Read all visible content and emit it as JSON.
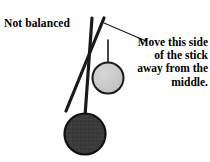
{
  "figure": {
    "background_color": "#ffffff",
    "ink_color": "#1a1a1a",
    "labels": {
      "not_balanced": "Not balanced",
      "callout": "Move this side of the stick away from the middle."
    },
    "parts": {
      "vertical_stick_name": "vertical-stick",
      "diagonal_stick_name": "diagonal-stick",
      "hanger_line_name": "hanger-line",
      "leader_line_name": "callout-leader-line"
    },
    "weights": [
      {
        "id": "light-weight",
        "shape": "circle",
        "fill": "#c9c9c9",
        "stroke": "#1a1a1a",
        "cx": 108,
        "cy": 78,
        "r": 15.5
      },
      {
        "id": "heavy-weight",
        "shape": "circle",
        "fill": "#3b3b3b",
        "stroke": "#101010",
        "cx": 85,
        "cy": 134,
        "r": 20.5
      }
    ],
    "sticks": [
      {
        "id": "vertical-stick",
        "x1": 92,
        "y1": 18,
        "x2": 85,
        "y2": 116,
        "width": 3.2
      },
      {
        "id": "diagonal-stick",
        "x1": 104,
        "y1": 18,
        "x2": 66,
        "y2": 111,
        "width": 3.2
      }
    ],
    "hanger": {
      "x1": 108,
      "y1": 40,
      "x2": 108,
      "y2": 62,
      "width": 1.6
    },
    "leader": {
      "x1": 104,
      "y1": 23,
      "x2": 146,
      "y2": 41,
      "width": 1.2
    }
  }
}
